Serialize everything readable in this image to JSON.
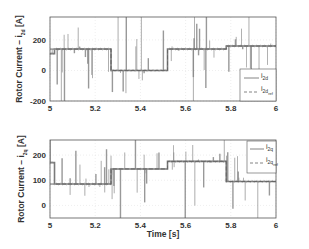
{
  "chart_data": [
    {
      "type": "line",
      "title": "",
      "xlabel": "",
      "ylabel": "Rotor Current - i_2d [A]",
      "ylabel_main": "Rotor Current – i",
      "ylabel_sub": "2d",
      "ylabel_unit": " [A]",
      "xlim": [
        5,
        6
      ],
      "ylim": [
        -200,
        350
      ],
      "xticks": [
        "5",
        "5.2",
        "5.4",
        "5.6",
        "5.8",
        "6"
      ],
      "yticks": [
        "-200",
        "0",
        "200"
      ],
      "grid": true,
      "legend_position": "lower right",
      "series": [
        {
          "name": "i_2d",
          "label_main": "i",
          "label_sub": "2d",
          "style": "solid",
          "segments": [
            {
              "t0": 5.0,
              "t1": 5.02,
              "value": 110
            },
            {
              "t0": 5.02,
              "t1": 5.27,
              "value": 140
            },
            {
              "t0": 5.27,
              "t1": 5.52,
              "value": 0
            },
            {
              "t0": 5.52,
              "t1": 5.78,
              "value": 140
            },
            {
              "t0": 5.78,
              "t1": 6.0,
              "value": 160
            }
          ],
          "note": "Steady levels with frequent transient spikes reaching axis limits"
        },
        {
          "name": "i_2d_ref",
          "label_main": "i",
          "label_sub": "2d",
          "label_subsub": "ref",
          "style": "dashed",
          "segments": [
            {
              "t0": 5.0,
              "t1": 5.27,
              "value": 140
            },
            {
              "t0": 5.27,
              "t1": 5.52,
              "value": 0
            },
            {
              "t0": 5.52,
              "t1": 5.78,
              "value": 140
            },
            {
              "t0": 5.78,
              "t1": 6.0,
              "value": 160
            }
          ]
        }
      ]
    },
    {
      "type": "line",
      "title": "",
      "xlabel": "Time [s]",
      "ylabel": "Rotor Current - i_2q [A]",
      "ylabel_main": "Rotor Current – i",
      "ylabel_sub": "2q",
      "ylabel_unit": " [A]",
      "xlim": [
        5,
        6
      ],
      "ylim": [
        -50,
        260
      ],
      "xticks": [
        "5",
        "5.2",
        "5.4",
        "5.6",
        "5.8",
        "6"
      ],
      "yticks": [
        "0",
        "100",
        "200"
      ],
      "grid": true,
      "legend_position": "upper right",
      "series": [
        {
          "name": "i_2q",
          "label_main": "i",
          "label_sub": "2q",
          "style": "solid",
          "segments": [
            {
              "t0": 5.0,
              "t1": 5.02,
              "value": 170
            },
            {
              "t0": 5.02,
              "t1": 5.27,
              "value": 85
            },
            {
              "t0": 5.27,
              "t1": 5.52,
              "value": 145
            },
            {
              "t0": 5.52,
              "t1": 5.78,
              "value": 175
            },
            {
              "t0": 5.78,
              "t1": 6.0,
              "value": 95
            }
          ],
          "note": "Steady levels with frequent transient spikes reaching axis limits"
        },
        {
          "name": "i_2q_ref",
          "label_main": "i",
          "label_sub": "2q",
          "label_subsub": "ref",
          "style": "dashed",
          "segments": [
            {
              "t0": 5.0,
              "t1": 5.27,
              "value": 85
            },
            {
              "t0": 5.27,
              "t1": 5.52,
              "value": 145
            },
            {
              "t0": 5.52,
              "t1": 5.78,
              "value": 175
            },
            {
              "t0": 5.78,
              "t1": 6.0,
              "value": 95
            }
          ]
        }
      ]
    }
  ],
  "colors": {
    "line": "#7a7a7a",
    "axis": "#555555",
    "grid": "#dddddd",
    "text": "#333333"
  }
}
